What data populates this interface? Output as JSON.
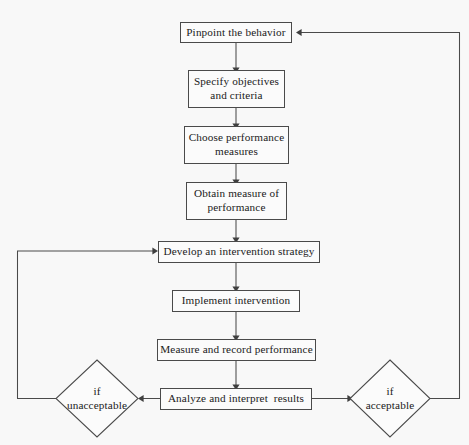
{
  "diagram": {
    "type": "flowchart",
    "background_color": "#f8f8f8",
    "line_color": "#4a4a4a",
    "text_color": "#1a1a1a",
    "nodes": [
      {
        "id": "pinpoint",
        "shape": "rectangle",
        "label": "Pinpoint the behavior",
        "lines": [
          "Pinpoint the behavior"
        ]
      },
      {
        "id": "objectives",
        "shape": "rectangle",
        "label": "Specify objectives and criteria",
        "lines": [
          "Specify objectives",
          "and criteria"
        ]
      },
      {
        "id": "measures",
        "shape": "rectangle",
        "label": "Choose performance measures",
        "lines": [
          "Choose performance",
          "measures"
        ]
      },
      {
        "id": "obtain",
        "shape": "rectangle",
        "label": "Obtain measure of performance",
        "lines": [
          "Obtain measure of",
          "performance"
        ]
      },
      {
        "id": "develop",
        "shape": "rectangle",
        "label": "Develop an intervention strategy",
        "lines": [
          "Develop an intervention strategy"
        ]
      },
      {
        "id": "implement",
        "shape": "rectangle",
        "label": "Implement intervention",
        "lines": [
          "Implement intervention"
        ]
      },
      {
        "id": "record",
        "shape": "rectangle",
        "label": "Measure and record performance",
        "lines": [
          "Measure and record performance"
        ]
      },
      {
        "id": "analyze",
        "shape": "rectangle",
        "label": "Analyze and interpret  results",
        "lines": [
          "Analyze and interpret  results"
        ]
      },
      {
        "id": "unacceptable",
        "shape": "diamond",
        "label": "if unacceptable",
        "lines": [
          "if",
          "unacceptable"
        ]
      },
      {
        "id": "acceptable",
        "shape": "diamond",
        "label": "if acceptable",
        "lines": [
          "if",
          "acceptable"
        ]
      }
    ],
    "edges": [
      {
        "from": "pinpoint",
        "to": "objectives",
        "arrow": "down"
      },
      {
        "from": "objectives",
        "to": "measures",
        "arrow": "down"
      },
      {
        "from": "measures",
        "to": "obtain",
        "arrow": "down"
      },
      {
        "from": "obtain",
        "to": "develop",
        "arrow": "down"
      },
      {
        "from": "develop",
        "to": "implement",
        "arrow": "down"
      },
      {
        "from": "implement",
        "to": "record",
        "arrow": "down"
      },
      {
        "from": "record",
        "to": "analyze",
        "arrow": "down"
      },
      {
        "from": "analyze",
        "to": "unacceptable",
        "arrow": "left"
      },
      {
        "from": "analyze",
        "to": "acceptable",
        "arrow": "right"
      },
      {
        "from": "unacceptable",
        "to": "develop",
        "arrow": "right",
        "style": "feedback-left-loop"
      },
      {
        "from": "acceptable",
        "to": "pinpoint",
        "arrow": "left",
        "style": "feedback-right-loop"
      }
    ]
  }
}
